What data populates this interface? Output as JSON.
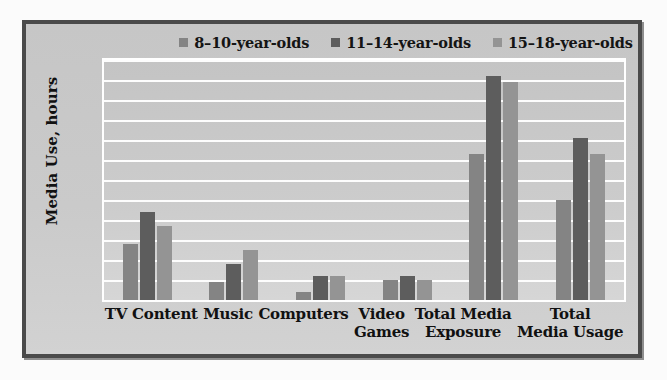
{
  "chart_data": {
    "type": "bar",
    "title": "",
    "xlabel": "",
    "ylabel": "Media Use, hours",
    "ylim": [
      0,
      12
    ],
    "ytick_labels": [
      "12:00",
      "10:00",
      "8:00",
      "6:00",
      "4:00",
      "2:00"
    ],
    "ytick_values": [
      12,
      10,
      8,
      6,
      4,
      2
    ],
    "gridlines": true,
    "gridline_values": [
      12,
      11,
      10,
      9,
      8,
      7,
      6,
      5,
      4,
      3,
      2,
      1
    ],
    "legend_position": "top",
    "categories": [
      "TV Content",
      "Music",
      "Computers",
      "Video\nGames",
      "Total Media\nExposure",
      "Total\nMedia Usage"
    ],
    "series": [
      {
        "name": "8–10-year-olds",
        "color": "#848484",
        "values": [
          2.8,
          0.9,
          0.4,
          1.0,
          7.3,
          5.0
        ],
        "value_labels": [
          "2:50",
          "0:55",
          "0:25",
          "1:00",
          "7:20",
          "5:00"
        ]
      },
      {
        "name": "11–14-year-olds",
        "color": "#5d5d5d",
        "values": [
          4.4,
          1.8,
          1.2,
          1.2,
          11.2,
          8.1
        ],
        "value_labels": [
          "4:25",
          "1:45",
          "1:10",
          "1:10",
          "11:10",
          "8:05"
        ]
      },
      {
        "name": "15–18-year-olds",
        "color": "#949494",
        "values": [
          3.7,
          2.5,
          1.2,
          1.0,
          10.9,
          7.3
        ],
        "value_labels": [
          "3:40",
          "2:30",
          "1:10",
          "1:00",
          "10:55",
          "7:20"
        ]
      }
    ]
  },
  "colors": {
    "frame_border": "#4a4a4a",
    "chart_background": "#c9c9c9",
    "plot_background": "#cccccc",
    "gridline": "#fdfdfd",
    "text": "#111111",
    "series_1": "#848484",
    "series_2": "#5d5d5d",
    "series_3": "#949494"
  }
}
